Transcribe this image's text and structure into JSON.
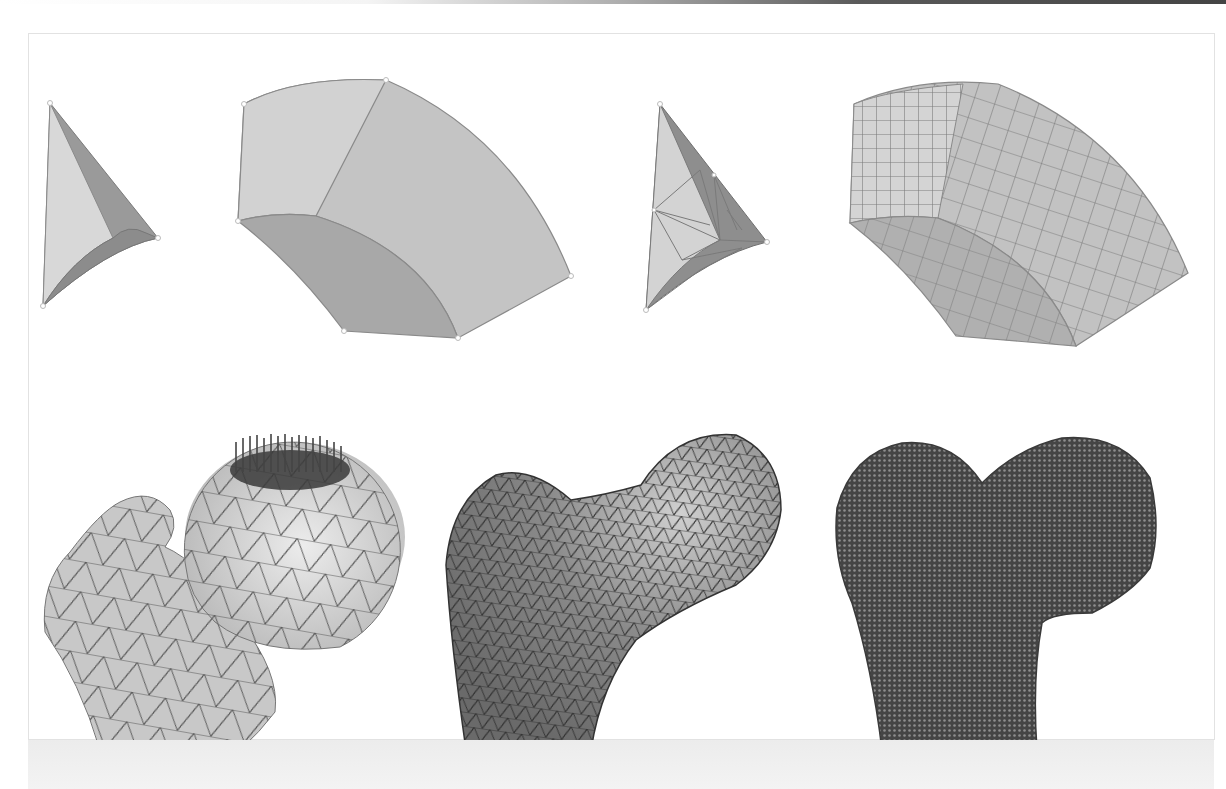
{
  "figure": {
    "title": "",
    "layout": {
      "rows": 2,
      "top_row_panels": 4,
      "bottom_row_panels": 3
    },
    "colors": {
      "background": "#ffffff",
      "frame_border": "#e2e2e2",
      "face_light": "#d6d6d6",
      "face_mid": "#bdbdbd",
      "face_dark": "#8f8f8f",
      "edge": "#6e6e6e",
      "mesh_line": "#3a3a3a",
      "voxel_dark": "#4a4a4a",
      "bottom_band": "#ededed"
    },
    "panels": [
      {
        "id": "a",
        "row": 1,
        "name": "tetrahedron-geometry",
        "element": "tetrahedral",
        "meshed": false
      },
      {
        "id": "b",
        "row": 1,
        "name": "hexahedron-geometry",
        "element": "hexahedral",
        "meshed": false
      },
      {
        "id": "c",
        "row": 1,
        "name": "tetrahedron-meshed",
        "element": "tetrahedral",
        "meshed": true
      },
      {
        "id": "d",
        "row": 1,
        "name": "hexahedron-meshed",
        "element": "hexahedral",
        "meshed": true
      },
      {
        "id": "e",
        "row": 2,
        "name": "femur-coarse-tet-mesh-with-load",
        "element": "tetrahedral",
        "load_arrows": true
      },
      {
        "id": "f",
        "row": 2,
        "name": "femur-fine-tet-mesh",
        "element": "tetrahedral",
        "load_arrows": false
      },
      {
        "id": "g",
        "row": 2,
        "name": "femur-voxel-hex-mesh",
        "element": "voxel",
        "load_arrows": false
      }
    ]
  }
}
